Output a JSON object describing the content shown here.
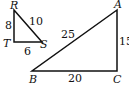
{
  "small_triangle": {
    "vertices": {
      "R": "R",
      "T": "T",
      "S": "S"
    },
    "sides": {
      "RT": "8",
      "RS": "10",
      "TS": "6"
    }
  },
  "large_triangle": {
    "vertices": {
      "A": "A",
      "B": "B",
      "C": "C"
    },
    "sides": {
      "AB": "25",
      "AC": "15",
      "BC": "20"
    }
  },
  "colors": {
    "stroke": "#111111"
  }
}
